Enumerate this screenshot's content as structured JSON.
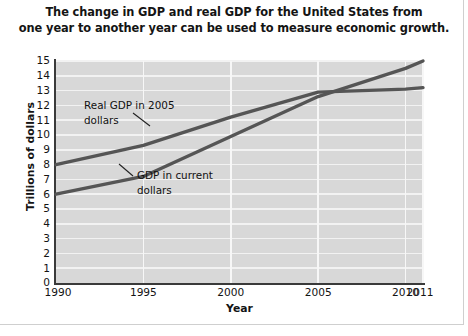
{
  "chart_data": {
    "type": "line",
    "title": "The change in GDP and real GDP for the United States from one year to another year can be used to measure economic growth.",
    "title_line1": "The change in GDP and real GDP for the United States from",
    "title_line2": "one year to another year can be used to measure economic growth.",
    "xlabel": "Year",
    "ylabel": "Trillions of dollars",
    "xlim": [
      1990,
      2011
    ],
    "ylim": [
      0,
      15
    ],
    "xticks": [
      "1990",
      "1995",
      "2000",
      "2005",
      "2010",
      "2011"
    ],
    "xtick_values": [
      1990,
      1995,
      2000,
      2005,
      2010,
      2011
    ],
    "yticks": [
      "0",
      "1",
      "2",
      "3",
      "4",
      "5",
      "6",
      "7",
      "8",
      "9",
      "10",
      "11",
      "12",
      "13",
      "14",
      "15"
    ],
    "ytick_values": [
      0,
      1,
      2,
      3,
      4,
      5,
      6,
      7,
      8,
      9,
      10,
      11,
      12,
      13,
      14,
      15
    ],
    "grid": true,
    "grid_color": "#f2f2f2",
    "plot_background": "#d8d8d8",
    "legend": "annotations",
    "line_color": "#555555",
    "series": [
      {
        "name": "Real GDP in 2005 dollars",
        "annotation": "Real GDP in 2005 dollars",
        "annotation_line1": "Real GDP in 2005",
        "annotation_line2": "dollars",
        "color": "#555555",
        "x": [
          1990,
          1995,
          2000,
          2005,
          2010,
          2011
        ],
        "values": [
          8.0,
          9.3,
          11.2,
          12.9,
          13.1,
          13.2
        ]
      },
      {
        "name": "GDP in current dollars",
        "annotation": "GDP in current dollars",
        "annotation_line1": "GDP in current",
        "annotation_line2": "dollars",
        "color": "#555555",
        "x": [
          1990,
          1995,
          2000,
          2005,
          2010,
          2011
        ],
        "values": [
          6.0,
          7.2,
          9.9,
          12.6,
          14.5,
          15.0
        ]
      }
    ]
  }
}
